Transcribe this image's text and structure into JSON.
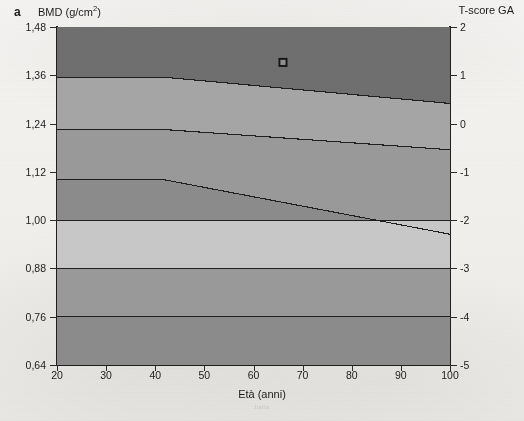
{
  "figure": {
    "panel_letter": "a",
    "left_axis_title": "BMD (g/cm",
    "left_axis_title_sup": "2",
    "left_axis_title_tail": ")",
    "right_axis_title": "T-score GA",
    "x_axis_title": "Età (anni)",
    "bleed_through_text": "Italia"
  },
  "chart_data": {
    "type": "area",
    "xlabel": "Età (anni)",
    "ylabel": "BMD (g/cm2)",
    "y2label": "T-score GA",
    "xlim": [
      20,
      100
    ],
    "ylim": [
      0.64,
      1.48
    ],
    "y2lim": [
      -5,
      2
    ],
    "grid": false,
    "legend": "none",
    "x_ticks": [
      20,
      30,
      40,
      50,
      60,
      70,
      80,
      90,
      100
    ],
    "x_tick_labels": [
      "20",
      "30",
      "40",
      "50",
      "60",
      "70",
      "80",
      "90",
      "100"
    ],
    "y_ticks": [
      0.64,
      0.76,
      0.88,
      1.0,
      1.12,
      1.24,
      1.36,
      1.48
    ],
    "y_tick_labels": [
      "0,64",
      "0,76",
      "0,88",
      "1,00",
      "1,12",
      "1,24",
      "1,36",
      "1,48"
    ],
    "y2_ticks": [
      -5,
      -4,
      -3,
      -2,
      -1,
      0,
      1,
      2
    ],
    "y2_tick_labels": [
      "-5",
      "-4",
      "-3",
      "-2",
      "-1",
      "0",
      "1",
      "2"
    ],
    "band_breakpoint_age": 42,
    "boundaries": [
      {
        "name": "T = +1",
        "tscore": 1,
        "points": [
          [
            20,
            1.355
          ],
          [
            42,
            1.355
          ],
          [
            100,
            1.29
          ]
        ]
      },
      {
        "name": "T = 0",
        "tscore": 0,
        "points": [
          [
            20,
            1.225
          ],
          [
            42,
            1.225
          ],
          [
            100,
            1.175
          ]
        ]
      },
      {
        "name": "T = -1",
        "tscore": -1,
        "points": [
          [
            20,
            1.1
          ],
          [
            42,
            1.1
          ],
          [
            100,
            0.965
          ]
        ]
      },
      {
        "name": "T = -2",
        "tscore": -2,
        "points": [
          [
            20,
            1.0
          ],
          [
            42,
            1.0
          ],
          [
            100,
            1.0
          ]
        ]
      },
      {
        "name": "T = -3",
        "tscore": -3,
        "points": [
          [
            20,
            0.88
          ],
          [
            42,
            0.88
          ],
          [
            100,
            0.88
          ]
        ]
      },
      {
        "name": "T = -4",
        "tscore": -4,
        "points": [
          [
            20,
            0.76
          ],
          [
            42,
            0.76
          ],
          [
            100,
            0.76
          ]
        ]
      }
    ],
    "bands": [
      {
        "name": "above +1",
        "fill": "#6f6f6f"
      },
      {
        "name": "+1 to 0",
        "fill": "#a6a6a6"
      },
      {
        "name": "0 to -1",
        "fill": "#9a9a9a"
      },
      {
        "name": "-1 to -2",
        "fill": "#8c8c8c"
      },
      {
        "name": "-2 to -3",
        "fill": "#c8c8c8"
      },
      {
        "name": "-3 to -4",
        "fill": "#9a9a9a"
      },
      {
        "name": "below -4",
        "fill": "#8c8c8c"
      }
    ],
    "markers": [
      {
        "name": "patient-point",
        "x": 66,
        "y": 1.392,
        "tscore": 1.2,
        "style": "square-outline"
      }
    ]
  }
}
